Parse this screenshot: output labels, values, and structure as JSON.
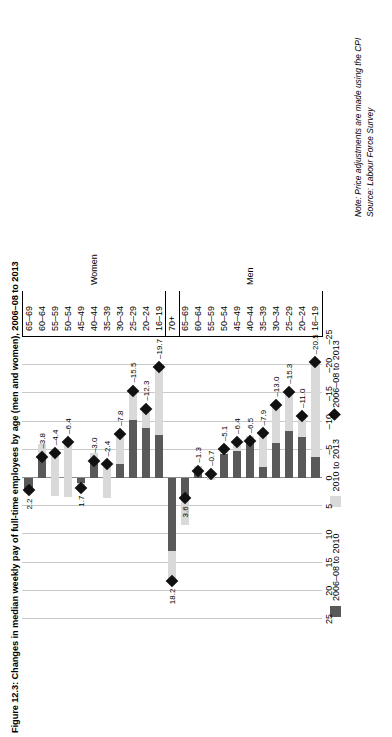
{
  "figure": {
    "title": "Figure 12.3: Changes in median weekly pay of full-time employees by age (men and women), 2006–08 to 2013",
    "note": "Note: Price adjustments are made using the CPI",
    "source": "Source: Labour Force Survey"
  },
  "legend": {
    "items": [
      {
        "label": "2006–08 to 2010",
        "marker": "square",
        "color": "#595959"
      },
      {
        "label": "2010 to 2013",
        "marker": "square",
        "color": "#d9d9d9"
      },
      {
        "label": "2006–08 to 2013",
        "marker": "diamond",
        "color": "#111111"
      }
    ]
  },
  "groups": [
    {
      "label": "Women"
    },
    {
      "label": "Men"
    }
  ],
  "chart_data": {
    "type": "bar",
    "orientation": "horizontal",
    "stacked": true,
    "title": "Figure 12.3: Changes in median weekly pay of full-time employees by age (men and women), 2006–08 to 2013",
    "xlabel": "",
    "ylabel": "",
    "xlim": [
      25,
      -25
    ],
    "xticks": [
      25,
      20,
      15,
      10,
      5,
      0,
      -5,
      -10,
      -15,
      -20,
      -25
    ],
    "grid": true,
    "legend_position": "top",
    "categories": [
      "65–69",
      "60–64",
      "55–59",
      "50–54",
      "45–49",
      "40–44",
      "35–39",
      "30–34",
      "25–29",
      "20–24",
      "16–19",
      "70+",
      "65–69",
      "60–64",
      "55–59",
      "50–54",
      "45–49",
      "40–44",
      "35–39",
      "30–34",
      "25–29",
      "20–24",
      "16–19"
    ],
    "series": [
      {
        "name": "2006–08 to 2010",
        "color": "#595959",
        "values": [
          2.6,
          -6.1,
          3.2,
          3.4,
          0.8,
          -4.4,
          3.5,
          -2.5,
          -10.3,
          -8.8,
          -7.6,
          13.0,
          8.4,
          -2.2,
          0.3,
          -4.3,
          -4.7,
          -7.4,
          -1.9,
          -6.2,
          -8.4,
          -7.2,
          -3.8
        ]
      },
      {
        "name": "2010 to 2013",
        "color": "#d9d9d9",
        "values": [
          -0.4,
          2.3,
          -7.6,
          -9.8,
          0.9,
          1.4,
          -5.9,
          -5.3,
          -5.2,
          -3.5,
          -12.1,
          5.2,
          -4.8,
          0.9,
          -1.0,
          -0.8,
          -1.7,
          0.9,
          -6.0,
          -6.8,
          -6.9,
          -3.8,
          -16.7
        ]
      }
    ],
    "markers": {
      "name": "2006–08 to 2013",
      "color": "#111111",
      "values": [
        2.2,
        -3.8,
        -4.4,
        -6.4,
        1.7,
        -3.0,
        -2.4,
        -7.8,
        -15.5,
        -12.3,
        -19.7,
        18.2,
        3.6,
        -1.3,
        -0.7,
        -5.1,
        -6.4,
        -6.5,
        -7.9,
        -13.0,
        -15.3,
        -11.0,
        -20.5
      ]
    },
    "data_labels": [
      "2.2",
      "–3.8",
      "–4.4",
      "–6.4",
      "1.7",
      "–3.0",
      "–2.4",
      "–7.8",
      "–15.5",
      "–12.3",
      "–19.7",
      "18.2",
      "3.6",
      "–1.3",
      "–0.7",
      "–5.1",
      "–6.4",
      "–6.5",
      "–7.9",
      "–13.0",
      "–15.3",
      "–11.0",
      "–20.5"
    ]
  }
}
